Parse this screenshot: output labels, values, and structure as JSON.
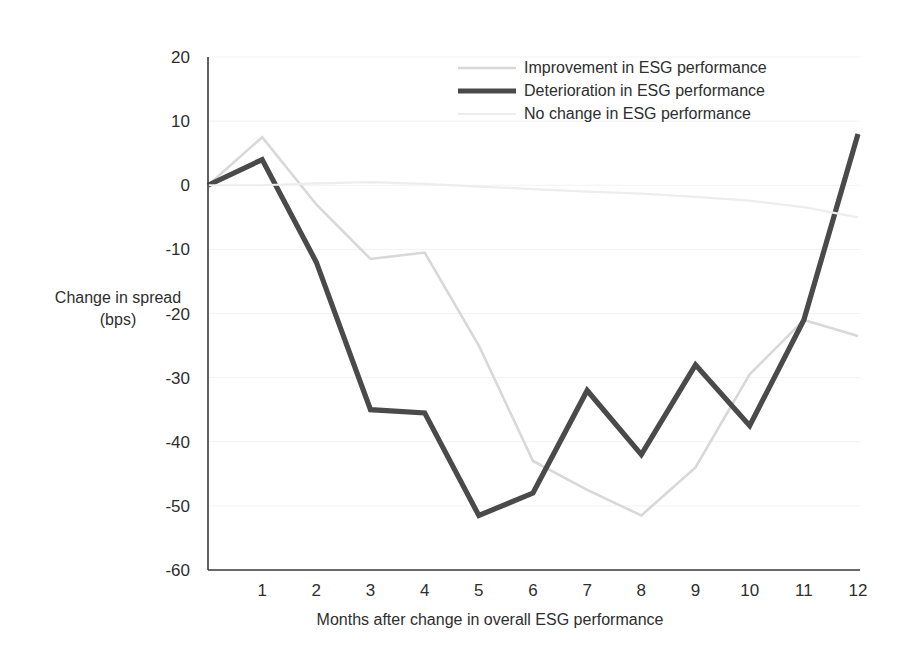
{
  "chart_data": {
    "type": "line",
    "title": "",
    "xlabel": "Months after change in overall ESG performance",
    "ylabel_line1": "Change in spread",
    "ylabel_line2": "(bps)",
    "x": [
      0,
      1,
      2,
      3,
      4,
      5,
      6,
      7,
      8,
      9,
      10,
      11,
      12
    ],
    "xtick_labels": [
      "1",
      "2",
      "3",
      "4",
      "5",
      "6",
      "7",
      "8",
      "9",
      "10",
      "11",
      "12"
    ],
    "xtick_values": [
      1,
      2,
      3,
      4,
      5,
      6,
      7,
      8,
      9,
      10,
      11,
      12
    ],
    "ytick_labels": [
      "20",
      "10",
      "0",
      "-10",
      "-20",
      "-30",
      "-40",
      "-50",
      "-60"
    ],
    "ytick_values": [
      20,
      10,
      0,
      -10,
      -20,
      -30,
      -40,
      -50,
      -60
    ],
    "ylim": [
      -60,
      20
    ],
    "xlim": [
      0,
      12
    ],
    "grid": true,
    "legend_position": "top-right",
    "series": [
      {
        "name": "Improvement in ESG performance",
        "color": "#d8d8d8",
        "width": 2.6,
        "values": [
          0,
          7.5,
          -3,
          -11.5,
          -10.5,
          -25,
          -43,
          -47.5,
          -51.5,
          -44,
          -29.5,
          -21,
          -23.5
        ]
      },
      {
        "name": "Deterioration in ESG performance",
        "color": "#4a4a4a",
        "width": 5.2,
        "values": [
          0,
          4,
          -12,
          -35,
          -35.5,
          -51.5,
          -48,
          -32,
          -42,
          -28,
          -37.5,
          -21,
          8
        ]
      },
      {
        "name": "No change in ESG performance",
        "color": "#ededed",
        "width": 2.2,
        "values": [
          0,
          0,
          0.3,
          0.5,
          0.2,
          -0.2,
          -0.6,
          -1,
          -1.3,
          -1.8,
          -2.4,
          -3.4,
          -5
        ]
      }
    ]
  },
  "legend": {
    "entries": [
      {
        "label": "Improvement in ESG performance",
        "color": "#d8d8d8",
        "width": 2.6
      },
      {
        "label": "Deterioration in ESG performance",
        "color": "#4a4a4a",
        "width": 5.2
      },
      {
        "label": "No change in ESG performance",
        "color": "#ededed",
        "width": 2.2
      }
    ]
  }
}
